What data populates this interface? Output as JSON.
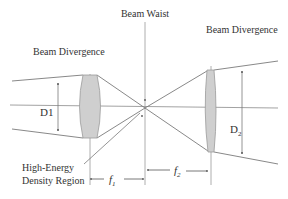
{
  "labels": {
    "beam_waist": "Beam Waist",
    "beam_divergence_left": "Beam Divergence",
    "beam_divergence_right": "Beam Divergence",
    "d1": "D1",
    "d2_main": "D",
    "d2_sub": "2",
    "f1_main": "f",
    "f1_sub": "1",
    "f2_main": "f",
    "f2_sub": "2",
    "high_energy_line1": "High-Energy",
    "high_energy_line2": "Density Region"
  },
  "colors": {
    "line": "#7a7a7a",
    "lens_fill": "#cfcfcf",
    "lens_stroke": "#9a9a9a",
    "text": "#333333",
    "background": "#ffffff"
  }
}
